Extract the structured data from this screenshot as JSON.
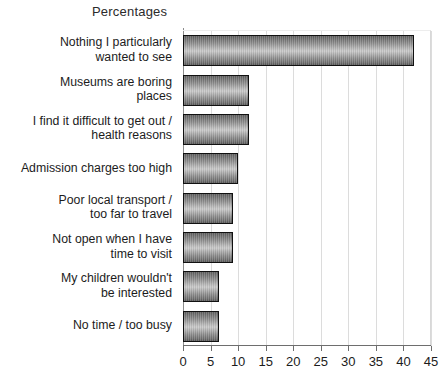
{
  "chart_data": {
    "type": "bar",
    "orientation": "horizontal",
    "title": "Percentages",
    "xlabel": "",
    "ylabel": "",
    "xlim": [
      0,
      45
    ],
    "xticks": [
      "0",
      "5",
      "10",
      "15",
      "20",
      "25",
      "30",
      "35",
      "40",
      "45"
    ],
    "grid": true,
    "legend": null,
    "categories": [
      "Nothing I particularly\nwanted to see",
      "Museums are boring\nplaces",
      "I find it difficult to get out /\nhealth reasons",
      "Admission charges too high",
      "Poor local transport /\ntoo far to travel",
      "Not open when I have\ntime to visit",
      "My children wouldn't\nbe interested",
      "No time / too busy"
    ],
    "values": [
      42,
      12,
      12,
      10,
      9,
      9,
      6.5,
      6.5
    ],
    "bar_fill": "#9a9a9a",
    "bar_edge": "#111111",
    "grid_color": "#dcdcdc",
    "axis_color": "#6e6e6e",
    "background": "#ffffff"
  }
}
